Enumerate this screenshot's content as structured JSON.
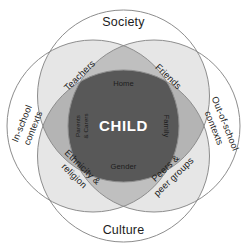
{
  "diagram": {
    "center": {
      "label": "CHILD",
      "fill": "#585858",
      "text_color": "#ffffff"
    },
    "outer_circles": [
      {
        "id": "society",
        "label": "Society",
        "position": "top"
      },
      {
        "id": "culture",
        "label": "Culture",
        "position": "bottom"
      },
      {
        "id": "in-school",
        "label": "In-school contexts",
        "label_line1": "In-school",
        "label_line2": "contexts",
        "position": "left"
      },
      {
        "id": "out-of-school",
        "label": "Out-of-school contexts",
        "label_line1": "Out-of-school",
        "label_line2": "contexts",
        "position": "right"
      }
    ],
    "quadrant_labels": [
      {
        "id": "teachers",
        "label": "Teachers",
        "line1": "Teachers",
        "line2": "",
        "position": "top-left"
      },
      {
        "id": "friends",
        "label": "Friends",
        "line1": "Friends",
        "line2": "",
        "position": "top-right"
      },
      {
        "id": "ethnicity-religion",
        "label": "Ethnicity & religion",
        "line1": "Ethnicity &",
        "line2": "religion",
        "position": "bottom-left"
      },
      {
        "id": "peers-peer-groups",
        "label": "Peers & peer groups",
        "line1": "Peers &",
        "line2": "peer groups",
        "position": "bottom-right"
      }
    ],
    "petal_labels": [
      {
        "id": "home",
        "label": "Home",
        "line1": "Home",
        "line2": "",
        "position": "top"
      },
      {
        "id": "family",
        "label": "Family",
        "line1": "Family",
        "line2": "",
        "position": "right"
      },
      {
        "id": "gender",
        "label": "Gender",
        "line1": "Gender",
        "line2": "",
        "position": "bottom"
      },
      {
        "id": "parents-carers",
        "label": "Parents & Carers",
        "line1": "Parents",
        "line2": "& Carers",
        "position": "left"
      }
    ],
    "colors": {
      "background": "#ffffff",
      "stroke": "#8d8d8d",
      "circle_fill": "#ffffff",
      "overlap_light": "#e3e3e3",
      "overlap_mid": "#cfcfcf",
      "overlap_dark": "#b2b2b2",
      "center_fill": "#585858"
    }
  }
}
